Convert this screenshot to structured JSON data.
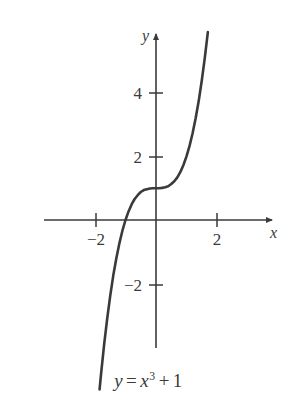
{
  "chart_data": {
    "type": "line",
    "title": "",
    "caption": "y = x^3 + 1",
    "function": "y = x^3 + 1",
    "xlabel": "x",
    "ylabel": "y",
    "xlim": [
      -2.6,
      4.0
    ],
    "ylim": [
      -4.6,
      6.4
    ],
    "grid": false,
    "legend": null,
    "x_ticks": [
      {
        "value": -2,
        "label": "−2"
      },
      {
        "value": 2,
        "label": "2"
      }
    ],
    "y_ticks": [
      {
        "value": -2,
        "label": "−2"
      },
      {
        "value": 2,
        "label": "2"
      },
      {
        "value": 4,
        "label": "4"
      }
    ],
    "series": [
      {
        "name": "y = x^3 + 1",
        "color": "#3a3a3a",
        "x": [
          -1.85,
          -1.8,
          -1.7,
          -1.6,
          -1.5,
          -1.4,
          -1.3,
          -1.2,
          -1.1,
          -1.0,
          -0.9,
          -0.8,
          -0.7,
          -0.6,
          -0.5,
          -0.4,
          -0.3,
          -0.2,
          -0.1,
          0.0,
          0.1,
          0.2,
          0.3,
          0.4,
          0.5,
          0.6,
          0.7,
          0.8,
          0.9,
          1.0,
          1.1,
          1.2,
          1.3,
          1.4,
          1.5,
          1.6,
          1.7
        ],
        "y": [
          -5.33,
          -4.83,
          -3.91,
          -3.1,
          -2.38,
          -1.74,
          -1.2,
          -0.73,
          -0.33,
          0.0,
          0.27,
          0.49,
          0.66,
          0.78,
          0.88,
          0.94,
          0.97,
          0.99,
          1.0,
          1.0,
          1.0,
          1.01,
          1.03,
          1.06,
          1.13,
          1.22,
          1.34,
          1.51,
          1.73,
          2.0,
          2.33,
          2.73,
          3.2,
          3.74,
          4.38,
          5.1,
          5.91
        ]
      }
    ],
    "key_points": {
      "y_intercept": 1,
      "x_intercept": -1,
      "inflection": [
        0,
        1
      ]
    }
  },
  "axes": {
    "x_axis_name": "x-axis",
    "y_axis_name": "y-axis",
    "x_label_text": "x",
    "y_label_text": "y",
    "axis_color": "#3a3a3a",
    "curve_color": "#3a3a3a"
  },
  "tick_labels": {
    "x_neg2": "−2",
    "x_pos2": "2",
    "y_neg2": "−2",
    "y_pos2": "2",
    "y_pos4": "4"
  },
  "caption": {
    "y": "y",
    "equals": "=",
    "x": "x",
    "exponent": "3",
    "plus": "+",
    "constant": "1",
    "full": "y = x³ + 1"
  }
}
